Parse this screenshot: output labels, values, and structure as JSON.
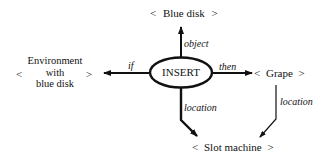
{
  "diagram": {
    "center": {
      "label": "INSERT",
      "shape": "ellipse"
    },
    "nodes": {
      "top": {
        "open": "<",
        "label": "Blue disk",
        "close": ">"
      },
      "left": {
        "open": "<",
        "lines": [
          "Environment",
          "with",
          "blue disk"
        ],
        "close": ">"
      },
      "right": {
        "open": "<",
        "label": "Grape",
        "close": ">"
      },
      "bottom": {
        "open": "<",
        "label": "Slot machine",
        "close": ">"
      }
    },
    "edges": {
      "object": "object",
      "if": "if",
      "then": "then",
      "location_insert": "location",
      "location_grape": "location"
    },
    "colors": {
      "stroke": "#111111",
      "background": "#ffffff"
    }
  }
}
